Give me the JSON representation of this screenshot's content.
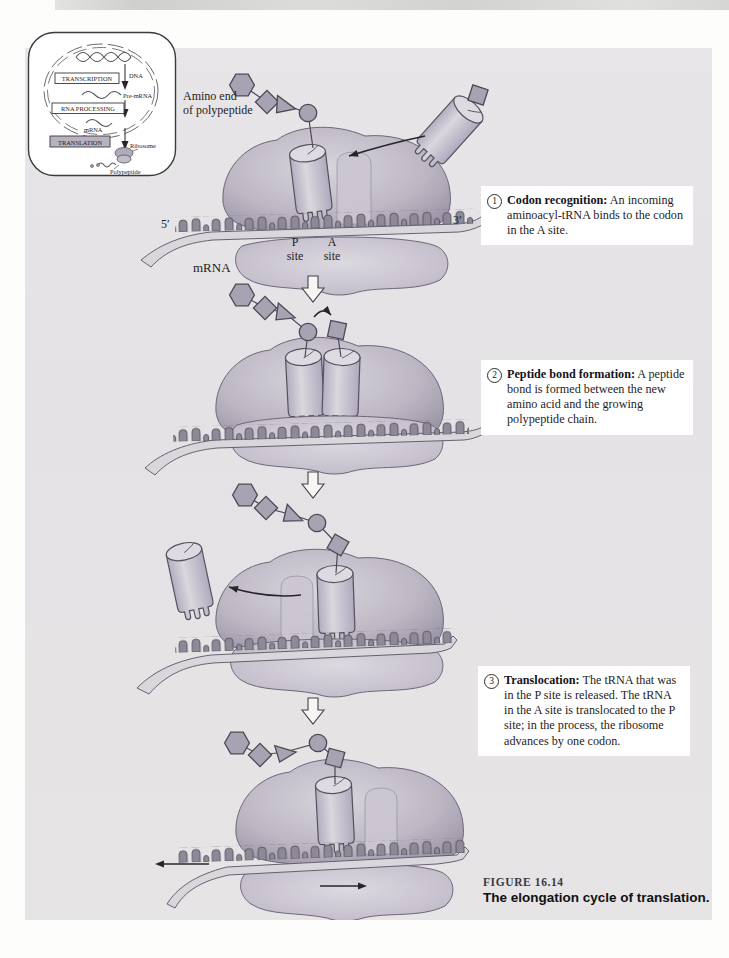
{
  "figure": {
    "caption_label": "FIGURE 16.14",
    "caption_title": "The elongation cycle of translation."
  },
  "inset": {
    "transcription": "TRANSCRIPTION",
    "dna": "DNA",
    "rna_processing": "RNA PROCESSING",
    "pre_mrna": "Pre-mRNA",
    "mrna": "mRNA",
    "translation": "TRANSLATION",
    "ribosome": "Ribosome",
    "polypeptide": "Polypeptide"
  },
  "step1": {
    "amino_end_line1": "Amino end",
    "amino_end_line2": "of polypeptide",
    "five_prime": "5′",
    "three_prime": "3′",
    "mrna_label": "mRNA",
    "p_site_letter": "P",
    "p_site_word": "site",
    "a_site_letter": "A",
    "a_site_word": "site"
  },
  "callouts": [
    {
      "number": "1",
      "title": "Codon recognition:",
      "body": "An incoming aminoacyl-tRNA binds to the codon in the A site."
    },
    {
      "number": "2",
      "title": "Peptide bond formation:",
      "body": "A peptide bond is formed between the new amino acid and the growing polypeptide chain."
    },
    {
      "number": "3",
      "title": "Translocation:",
      "body": "The tRNA that was in the P site is released. The tRNA in the A site is translocated to the P site; in the process, the ribosome advances by one codon."
    }
  ],
  "colors": {
    "panel_bg": "#e6e4e6",
    "ribosome_fill": "#bdb7c6",
    "ribosome_edge": "#9d96a8",
    "trna_fill": "#cfccd6",
    "mrna_bump": "#8e8897",
    "shape_fill": "#a8a2b2",
    "outline": "#4e4856",
    "callout_bg": "#ffffff",
    "text": "#1f1c24"
  }
}
